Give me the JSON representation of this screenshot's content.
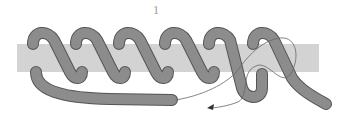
{
  "figure": {
    "step_label": "1",
    "colors": {
      "bar": "#d3d3d3",
      "rope": "#8c8c8c",
      "rope_outline": "#555555",
      "arrow": "#666666",
      "background": "#ffffff"
    },
    "coil_count": 6
  }
}
